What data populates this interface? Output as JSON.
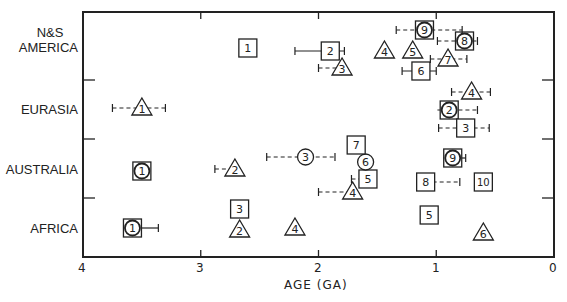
{
  "chart_data": {
    "type": "scatter",
    "title": "",
    "xlabel": "AGE (GA)",
    "ylabel": "",
    "xlim": [
      4,
      0
    ],
    "x_reversed": true,
    "xticks": [
      "4",
      "3",
      "2",
      "1",
      "0"
    ],
    "grid": false,
    "legend": null,
    "categories": [
      "N&S AMERICA",
      "EURASIA",
      "AUSTRALIA",
      "AFRICA"
    ],
    "marker_types": {
      "square": "numbered square",
      "triangle": "numbered triangle",
      "circle": "numbered circle",
      "circle-square": "numbered circle inside square"
    },
    "points": [
      {
        "region": "N&S AMERICA",
        "label": "1",
        "marker": "square",
        "age": 2.6
      },
      {
        "region": "N&S AMERICA",
        "label": "2",
        "marker": "square",
        "age": 1.9,
        "err": [
          2.2,
          1.78
        ],
        "err_style": "solid"
      },
      {
        "region": "N&S AMERICA",
        "label": "3",
        "marker": "triangle",
        "age": 1.8,
        "err": [
          2.0,
          1.8
        ],
        "err_style": "dashed"
      },
      {
        "region": "N&S AMERICA",
        "label": "4",
        "marker": "triangle",
        "age": 1.44
      },
      {
        "region": "N&S AMERICA",
        "label": "5",
        "marker": "triangle",
        "age": 1.2
      },
      {
        "region": "N&S AMERICA",
        "label": "6",
        "marker": "square",
        "age": 1.13,
        "err": [
          1.29,
          1.0
        ],
        "err_style": "solid"
      },
      {
        "region": "N&S AMERICA",
        "label": "7",
        "marker": "triangle",
        "age": 0.9,
        "err": [
          1.05,
          0.74
        ],
        "err_style": "dashed"
      },
      {
        "region": "N&S AMERICA",
        "label": "8",
        "marker": "circle-square",
        "age": 0.76,
        "err": [
          0.99,
          0.65
        ],
        "err_style": "dashed"
      },
      {
        "region": "N&S AMERICA",
        "label": "9",
        "marker": "circle-square",
        "age": 1.1,
        "err": [
          1.34,
          0.78
        ],
        "err_style": "dashed"
      },
      {
        "region": "EURASIA",
        "label": "1",
        "marker": "triangle",
        "age": 3.5,
        "err": [
          3.75,
          3.3
        ],
        "err_style": "dashed"
      },
      {
        "region": "EURASIA",
        "label": "2",
        "marker": "circle-square",
        "age": 0.89,
        "err": [
          0.99,
          0.65
        ],
        "err_style": "dashed"
      },
      {
        "region": "EURASIA",
        "label": "3",
        "marker": "square",
        "age": 0.75,
        "err": [
          0.98,
          0.55
        ],
        "err_style": "dashed"
      },
      {
        "region": "EURASIA",
        "label": "4",
        "marker": "triangle",
        "age": 0.7,
        "err": [
          0.87,
          0.54
        ],
        "err_style": "dashed"
      },
      {
        "region": "AUSTRALIA",
        "label": "1",
        "marker": "circle-square",
        "age": 3.5
      },
      {
        "region": "AUSTRALIA",
        "label": "2",
        "marker": "triangle",
        "age": 2.71,
        "err": [
          2.88,
          2.71
        ],
        "err_style": "dashed"
      },
      {
        "region": "AUSTRALIA",
        "label": "3",
        "marker": "circle",
        "age": 2.11,
        "err": [
          2.44,
          1.86
        ],
        "err_style": "dashed"
      },
      {
        "region": "AUSTRALIA",
        "label": "4",
        "marker": "triangle",
        "age": 1.71,
        "err": [
          2.0,
          1.71
        ],
        "err_style": "dashed"
      },
      {
        "region": "AUSTRALIA",
        "label": "5",
        "marker": "square",
        "age": 1.58,
        "err": [
          1.72,
          1.58
        ],
        "err_style": "dashed"
      },
      {
        "region": "AUSTRALIA",
        "label": "6",
        "marker": "circle",
        "age": 1.6
      },
      {
        "region": "AUSTRALIA",
        "label": "7",
        "marker": "square",
        "age": 1.68
      },
      {
        "region": "AUSTRALIA",
        "label": "8",
        "marker": "square",
        "age": 1.09,
        "err": [
          1.09,
          0.8
        ],
        "err_style": "dashed"
      },
      {
        "region": "AUSTRALIA",
        "label": "9",
        "marker": "circle-square",
        "age": 0.86,
        "err": [
          0.94,
          0.75
        ],
        "err_style": "solid"
      },
      {
        "region": "AUSTRALIA",
        "label": "10",
        "marker": "square",
        "age": 0.6
      },
      {
        "region": "AFRICA",
        "label": "1",
        "marker": "circle-square",
        "age": 3.58,
        "err": [
          3.58,
          3.36
        ],
        "err_style": "solid"
      },
      {
        "region": "AFRICA",
        "label": "2",
        "marker": "triangle",
        "age": 2.67
      },
      {
        "region": "AFRICA",
        "label": "3",
        "marker": "square",
        "age": 2.67
      },
      {
        "region": "AFRICA",
        "label": "4",
        "marker": "triangle",
        "age": 2.2
      },
      {
        "region": "AFRICA",
        "label": "5",
        "marker": "square",
        "age": 1.06
      },
      {
        "region": "AFRICA",
        "label": "6",
        "marker": "triangle",
        "age": 0.6
      }
    ]
  },
  "labels": {
    "row_america_1": "N&S",
    "row_america_2": "AMERICA",
    "row_eurasia": "EURASIA",
    "row_australia": "AUSTRALIA",
    "row_africa": "AFRICA",
    "xlabel": "AGE (GA)",
    "tick_4": "4",
    "tick_3": "3",
    "tick_2": "2",
    "tick_1": "1",
    "tick_0": "0"
  }
}
